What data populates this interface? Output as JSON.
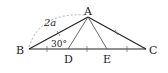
{
  "figure": {
    "type": "triangle-diagram",
    "vertices": {
      "A": {
        "label": "A",
        "x": 88,
        "y": 17
      },
      "B": {
        "label": "B",
        "x": 29,
        "y": 49
      },
      "C": {
        "label": "C",
        "x": 146,
        "y": 49
      },
      "D": {
        "label": "D",
        "x": 68,
        "y": 49
      },
      "E": {
        "label": "E",
        "x": 107,
        "y": 49
      }
    },
    "segments": [
      "AB",
      "AC",
      "BC",
      "AD",
      "AE"
    ],
    "annotations": {
      "side_AB": "2a",
      "angle_B": "30°"
    },
    "tick_marks": "BC divided into equal parts; AB and AC marked equal",
    "colors": {
      "stroke": "#222222",
      "dashed": "#999999"
    }
  }
}
